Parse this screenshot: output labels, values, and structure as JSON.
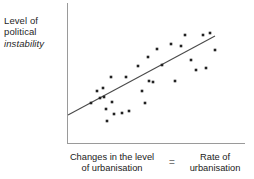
{
  "figure": {
    "y_axis_label_lines": [
      "Level of",
      "political",
      "instability"
    ],
    "x_caption": {
      "left_lines": [
        "Changes in the level",
        "of urbanisation"
      ],
      "equals": "=",
      "right_lines": [
        "Rate of",
        "urbanisation"
      ]
    },
    "colors": {
      "axis": "#9a9a9a",
      "point": "#222222",
      "trend_line": "#4a4a4a",
      "text": "#1f1f1f",
      "background": "#ffffff"
    }
  },
  "chart_data": {
    "type": "scatter",
    "title": "",
    "subtitle": "",
    "xlabel": "Changes in the level of urbanisation = Rate of urbanisation",
    "ylabel": "Level of political instability",
    "grid": false,
    "legend": "none",
    "axes_shown": [
      "left",
      "bottom"
    ],
    "tick_labels": {
      "x": [],
      "y": []
    },
    "xlim": [
      0,
      178
    ],
    "ylim": [
      0,
      141
    ],
    "note": "Coordinates are in plot-area pixels; y measured downward from plot top (lower y = higher political instability).",
    "points": [
      [
        24,
        100
      ],
      [
        30,
        88
      ],
      [
        33,
        95
      ],
      [
        36,
        85
      ],
      [
        37,
        94
      ],
      [
        39,
        106
      ],
      [
        40,
        118
      ],
      [
        44,
        74
      ],
      [
        45,
        99
      ],
      [
        47,
        111
      ],
      [
        55,
        110
      ],
      [
        59,
        74
      ],
      [
        62,
        108
      ],
      [
        71,
        63
      ],
      [
        75,
        88
      ],
      [
        78,
        100
      ],
      [
        81,
        54
      ],
      [
        82,
        78
      ],
      [
        86,
        79
      ],
      [
        90,
        46
      ],
      [
        95,
        62
      ],
      [
        104,
        41
      ],
      [
        108,
        78
      ],
      [
        114,
        43
      ],
      [
        118,
        32
      ],
      [
        124,
        57
      ],
      [
        129,
        67
      ],
      [
        136,
        32
      ],
      [
        139,
        65
      ],
      [
        143,
        30
      ],
      [
        148,
        47
      ]
    ],
    "trend_line": {
      "x1": 1,
      "y1": 112,
      "x2": 148,
      "y2": 33
    },
    "point_marker": {
      "shape": "square",
      "size_px": 2.6
    }
  }
}
